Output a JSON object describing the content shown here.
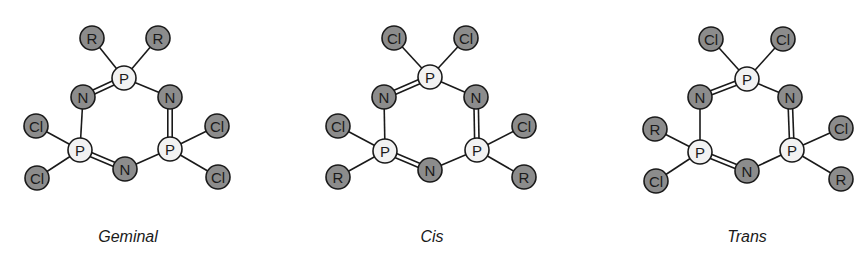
{
  "figure": {
    "molecules": [
      {
        "name": "geminal",
        "caption": "Geminal",
        "caption_x": 128,
        "atoms": [
          {
            "id": "P1",
            "label": "P",
            "type": "light",
            "x": 124,
            "y": 78
          },
          {
            "id": "N1",
            "label": "N",
            "type": "dark",
            "x": 83,
            "y": 97
          },
          {
            "id": "N2",
            "label": "N",
            "type": "dark",
            "x": 170,
            "y": 97
          },
          {
            "id": "P2",
            "label": "P",
            "type": "light",
            "x": 80,
            "y": 150
          },
          {
            "id": "P3",
            "label": "P",
            "type": "light",
            "x": 170,
            "y": 149
          },
          {
            "id": "N3",
            "label": "N",
            "type": "dark",
            "x": 125,
            "y": 169
          },
          {
            "id": "S1",
            "label": "R",
            "type": "dark",
            "x": 92,
            "y": 38
          },
          {
            "id": "S2",
            "label": "R",
            "type": "dark",
            "x": 158,
            "y": 38
          },
          {
            "id": "S3",
            "label": "Cl",
            "type": "dark",
            "x": 36,
            "y": 126
          },
          {
            "id": "S4",
            "label": "Cl",
            "type": "dark",
            "x": 37,
            "y": 178
          },
          {
            "id": "S5",
            "label": "Cl",
            "type": "dark",
            "x": 217,
            "y": 126
          },
          {
            "id": "S6",
            "label": "Cl",
            "type": "dark",
            "x": 218,
            "y": 177
          }
        ]
      },
      {
        "name": "cis",
        "caption": "Cis",
        "caption_x": 432,
        "atoms": [
          {
            "id": "P1",
            "label": "P",
            "type": "light",
            "x": 430,
            "y": 77
          },
          {
            "id": "N1",
            "label": "N",
            "type": "dark",
            "x": 384,
            "y": 97
          },
          {
            "id": "N2",
            "label": "N",
            "type": "dark",
            "x": 476,
            "y": 97
          },
          {
            "id": "P2",
            "label": "P",
            "type": "light",
            "x": 385,
            "y": 151
          },
          {
            "id": "P3",
            "label": "P",
            "type": "light",
            "x": 477,
            "y": 150
          },
          {
            "id": "N3",
            "label": "N",
            "type": "dark",
            "x": 430,
            "y": 170
          },
          {
            "id": "S1",
            "label": "Cl",
            "type": "dark",
            "x": 394,
            "y": 38
          },
          {
            "id": "S2",
            "label": "Cl",
            "type": "dark",
            "x": 466,
            "y": 38
          },
          {
            "id": "S3",
            "label": "Cl",
            "type": "dark",
            "x": 338,
            "y": 126
          },
          {
            "id": "S4",
            "label": "R",
            "type": "dark",
            "x": 338,
            "y": 177
          },
          {
            "id": "S5",
            "label": "Cl",
            "type": "dark",
            "x": 524,
            "y": 126
          },
          {
            "id": "S6",
            "label": "R",
            "type": "dark",
            "x": 524,
            "y": 177
          }
        ]
      },
      {
        "name": "trans",
        "caption": "Trans",
        "caption_x": 747,
        "atoms": [
          {
            "id": "P1",
            "label": "P",
            "type": "light",
            "x": 747,
            "y": 79
          },
          {
            "id": "N1",
            "label": "N",
            "type": "dark",
            "x": 700,
            "y": 97
          },
          {
            "id": "N2",
            "label": "N",
            "type": "dark",
            "x": 790,
            "y": 97
          },
          {
            "id": "P2",
            "label": "P",
            "type": "light",
            "x": 700,
            "y": 152
          },
          {
            "id": "P3",
            "label": "P",
            "type": "light",
            "x": 792,
            "y": 150
          },
          {
            "id": "N3",
            "label": "N",
            "type": "dark",
            "x": 747,
            "y": 171
          },
          {
            "id": "S1",
            "label": "Cl",
            "type": "dark",
            "x": 711,
            "y": 39
          },
          {
            "id": "S2",
            "label": "Cl",
            "type": "dark",
            "x": 783,
            "y": 39
          },
          {
            "id": "S3",
            "label": "R",
            "type": "dark",
            "x": 655,
            "y": 129
          },
          {
            "id": "S4",
            "label": "Cl",
            "type": "dark",
            "x": 656,
            "y": 181
          },
          {
            "id": "S5",
            "label": "Cl",
            "type": "dark",
            "x": 841,
            "y": 128
          },
          {
            "id": "S6",
            "label": "R",
            "type": "dark",
            "x": 841,
            "y": 179
          }
        ]
      }
    ],
    "bonds": [
      {
        "a": "P1",
        "b": "N1",
        "order": 2
      },
      {
        "a": "P1",
        "b": "N2",
        "order": 1
      },
      {
        "a": "N2",
        "b": "P3",
        "order": 2
      },
      {
        "a": "P3",
        "b": "N3",
        "order": 1
      },
      {
        "a": "N3",
        "b": "P2",
        "order": 2
      },
      {
        "a": "P2",
        "b": "N1",
        "order": 1
      },
      {
        "a": "P1",
        "b": "S1",
        "order": 1
      },
      {
        "a": "P1",
        "b": "S2",
        "order": 1
      },
      {
        "a": "P2",
        "b": "S3",
        "order": 1
      },
      {
        "a": "P2",
        "b": "S4",
        "order": 1
      },
      {
        "a": "P3",
        "b": "S5",
        "order": 1
      },
      {
        "a": "P3",
        "b": "S6",
        "order": 1
      }
    ],
    "colors": {
      "substituent_fill": "#8c8c8c",
      "phosphorus_fill": "#f2f2f2",
      "stroke": "#1a1a1a"
    },
    "atom_radius": 12
  }
}
